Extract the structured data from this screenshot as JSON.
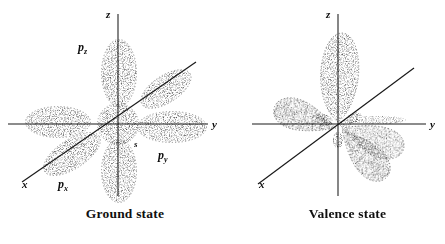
{
  "figure": {
    "background_color": "#ffffff",
    "ink_color": "#1a1a1a",
    "width": 445,
    "height": 244,
    "style": "stippled engraving"
  },
  "panels": [
    {
      "id": "ground",
      "caption": "Ground state",
      "axes": [
        {
          "name": "z",
          "label": "z"
        },
        {
          "name": "y",
          "label": "y"
        },
        {
          "name": "x",
          "label": "x"
        }
      ],
      "orbitals": [
        {
          "name": "s",
          "label": "s",
          "sub": ""
        },
        {
          "name": "p_x",
          "label": "p",
          "sub": "x"
        },
        {
          "name": "p_y",
          "label": "p",
          "sub": "y"
        },
        {
          "name": "p_z",
          "label": "p",
          "sub": "z"
        }
      ]
    },
    {
      "id": "valence",
      "caption": "Valence state",
      "axes": [
        {
          "name": "z",
          "label": "z"
        },
        {
          "name": "y",
          "label": "y"
        },
        {
          "name": "x",
          "label": "x"
        }
      ],
      "orbitals": []
    }
  ]
}
